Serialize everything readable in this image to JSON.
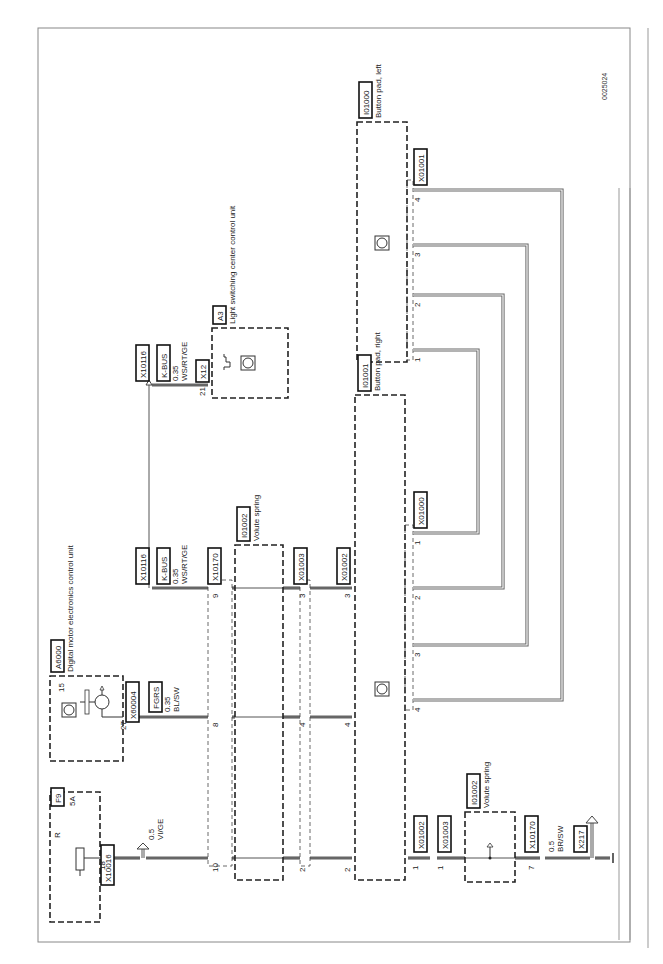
{
  "doc_id": "0025024",
  "components": {
    "f9": {
      "id": "F9",
      "rating": "5A",
      "terminal": "R",
      "connector": "X10016",
      "pin": "18"
    },
    "a6000": {
      "id": "A6000",
      "name": "Digital motor electronics control unit",
      "connector": "X60004",
      "pin_out": "27",
      "pin_internal": "15"
    },
    "a3": {
      "id": "A3",
      "name": "Light switching center control unit",
      "connector": "X12",
      "pin": "21"
    },
    "volute_spring_upper": {
      "id": "I01002",
      "name": "Volute spring"
    },
    "volute_spring_lower": {
      "id": "I01002",
      "name": "Volute spring"
    },
    "button_pad_right": {
      "id": "I01001",
      "name": "Button pad, right",
      "connector": "X01000",
      "pins": [
        "1",
        "2",
        "3",
        "4"
      ]
    },
    "button_pad_left": {
      "id": "I01000",
      "name": "Button pad, left",
      "connector": "X01001",
      "pins": [
        "1",
        "2",
        "3",
        "4"
      ]
    }
  },
  "connectors": {
    "x10116_top": "X10116",
    "x10116_mid": "X10116",
    "x10170_upper": "X10170",
    "x10170_lower": "X10170",
    "x01003_upper": "X01003",
    "x01002_upper": "X01002",
    "x01002_lower": "X01002",
    "x01003_lower": "X01003",
    "x217": "X217"
  },
  "wires": {
    "kbus_top": {
      "name": "K-BUS",
      "gauge": "0.35",
      "color": "WS/RT/GE"
    },
    "kbus_mid": {
      "name": "K-BUS",
      "gauge": "0.35",
      "color": "WS/RT/GE"
    },
    "fgrs": {
      "name": "FGRS",
      "gauge": "0.35",
      "color": "BL/SW"
    },
    "vi_ge": {
      "gauge": "0.5",
      "color": "VI/GE"
    },
    "br_sw": {
      "gauge": "0.5",
      "color": "BR/SW"
    }
  },
  "pins": {
    "row_vige": {
      "x10170": "10",
      "x01003": "2",
      "x01002": "2"
    },
    "row_fgrs": {
      "x10170": "8",
      "x01003": "4",
      "x01002": "4"
    },
    "row_kbus": {
      "x10170": "9",
      "x01003": "3",
      "x01002": "3"
    },
    "row_lower": {
      "x01002": "1",
      "x01003": "1",
      "x10170": "7"
    }
  }
}
